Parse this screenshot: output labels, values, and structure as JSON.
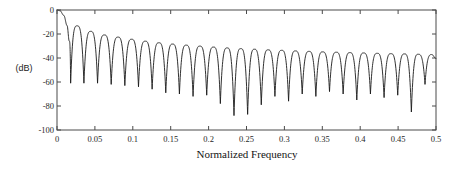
{
  "chart_data": {
    "type": "line",
    "title": "",
    "xlabel": "Normalized Frequency",
    "ylabel": "(dB)",
    "xlim": [
      0,
      0.5
    ],
    "ylim": [
      -100,
      0
    ],
    "grid": false,
    "legend": null,
    "xticks": [
      "0",
      "0.05",
      "0.1",
      "0.15",
      "0.2",
      "0.25",
      "0.3",
      "0.35",
      "0.4",
      "0.45",
      "0.5"
    ],
    "xtick_values": [
      0,
      0.05,
      0.1,
      0.15,
      0.2,
      0.25,
      0.3,
      0.35,
      0.4,
      0.45,
      0.5
    ],
    "yticks": [
      "0",
      "-20",
      "-40",
      "-60",
      "-80",
      "-100"
    ],
    "ytick_values": [
      0,
      -20,
      -40,
      -60,
      -80,
      -100
    ],
    "line_color": "#1a1a1a",
    "line_width": 0.9,
    "axis_color": "#4a4a4a",
    "background": "#ffffff",
    "series": [
      {
        "name": "magnitude response",
        "sidelobe_peaks": {
          "x": [
            0.0265,
            0.0445,
            0.0625,
            0.0805,
            0.0985,
            0.1165,
            0.1345,
            0.1525,
            0.1705,
            0.1885,
            0.2065,
            0.2245,
            0.2425,
            0.2605,
            0.2785,
            0.2965,
            0.3145,
            0.3325,
            0.3505,
            0.3685,
            0.3865,
            0.4045,
            0.4225,
            0.4405,
            0.4585,
            0.4765,
            0.4945
          ],
          "y": [
            -13.2,
            -17.8,
            -20.8,
            -22.6,
            -24.4,
            -26.0,
            -27.3,
            -28.4,
            -29.3,
            -30.1,
            -30.9,
            -31.6,
            -32.2,
            -32.7,
            -33.2,
            -33.6,
            -34.1,
            -34.5,
            -34.9,
            -35.2,
            -35.5,
            -35.8,
            -36.1,
            -36.4,
            -36.6,
            -36.9,
            -37.1
          ]
        },
        "nulls": {
          "x": [
            0.018,
            0.0355,
            0.0535,
            0.0715,
            0.0895,
            0.1075,
            0.1255,
            0.1435,
            0.1615,
            0.1795,
            0.1975,
            0.2155,
            0.2335,
            0.2515,
            0.2695,
            0.2875,
            0.3055,
            0.3235,
            0.3415,
            0.3595,
            0.3775,
            0.3955,
            0.4135,
            0.4315,
            0.4495,
            0.4675,
            0.4855
          ],
          "y": [
            -61,
            -61,
            -61,
            -62,
            -63,
            -64,
            -66,
            -69,
            -70,
            -72,
            -71,
            -78,
            -88,
            -87,
            -79,
            -72,
            -76,
            -70,
            -72,
            -68,
            -70,
            -75,
            -70,
            -73,
            -71,
            -85,
            -62
          ]
        }
      }
    ]
  }
}
